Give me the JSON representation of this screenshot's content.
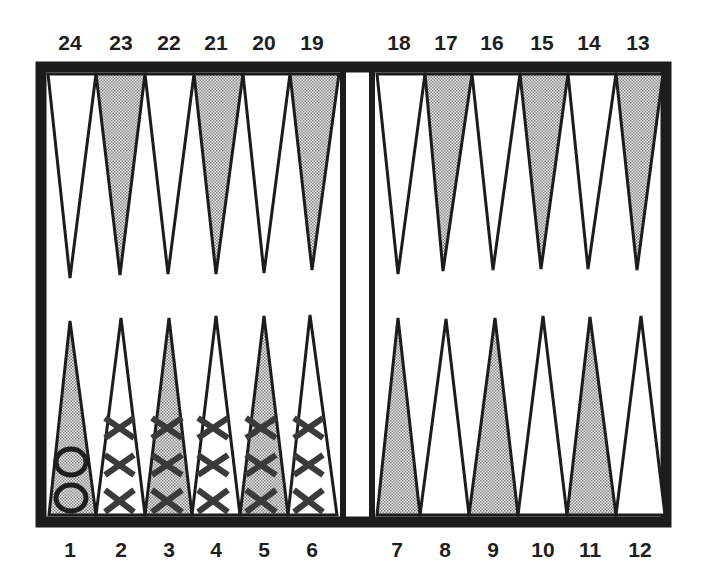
{
  "game": "backgammon",
  "colors": {
    "frame": "#1c1c1c",
    "board_bg": "#ffffff",
    "shaded_point": "#bdbdbd",
    "light_point": "#ffffff",
    "checker_x": "#3a3a3a",
    "checker_o": "#1e1e1e",
    "label": "#1e1e1e"
  },
  "top_labels": [
    "24",
    "23",
    "22",
    "21",
    "20",
    "19",
    "18",
    "17",
    "16",
    "15",
    "14",
    "13"
  ],
  "bottom_labels": [
    "1",
    "2",
    "3",
    "4",
    "5",
    "6",
    "7",
    "8",
    "9",
    "10",
    "11",
    "12"
  ],
  "points": {
    "top": [
      {
        "number": 24,
        "shade": "light"
      },
      {
        "number": 23,
        "shade": "dark"
      },
      {
        "number": 22,
        "shade": "light"
      },
      {
        "number": 21,
        "shade": "dark"
      },
      {
        "number": 20,
        "shade": "light"
      },
      {
        "number": 19,
        "shade": "dark"
      },
      {
        "number": 18,
        "shade": "light"
      },
      {
        "number": 17,
        "shade": "dark"
      },
      {
        "number": 16,
        "shade": "light"
      },
      {
        "number": 15,
        "shade": "dark"
      },
      {
        "number": 14,
        "shade": "light"
      },
      {
        "number": 13,
        "shade": "dark"
      }
    ],
    "bottom": [
      {
        "number": 1,
        "shade": "dark"
      },
      {
        "number": 2,
        "shade": "light"
      },
      {
        "number": 3,
        "shade": "dark"
      },
      {
        "number": 4,
        "shade": "light"
      },
      {
        "number": 5,
        "shade": "dark"
      },
      {
        "number": 6,
        "shade": "light"
      },
      {
        "number": 7,
        "shade": "dark"
      },
      {
        "number": 8,
        "shade": "light"
      },
      {
        "number": 9,
        "shade": "dark"
      },
      {
        "number": 10,
        "shade": "light"
      },
      {
        "number": 11,
        "shade": "dark"
      },
      {
        "number": 12,
        "shade": "light"
      }
    ]
  },
  "checkers": [
    {
      "point": 1,
      "player": "O",
      "count": 2
    },
    {
      "point": 2,
      "player": "X",
      "count": 3
    },
    {
      "point": 3,
      "player": "X",
      "count": 3
    },
    {
      "point": 4,
      "player": "X",
      "count": 3
    },
    {
      "point": 5,
      "player": "X",
      "count": 3
    },
    {
      "point": 6,
      "player": "X",
      "count": 3
    }
  ]
}
